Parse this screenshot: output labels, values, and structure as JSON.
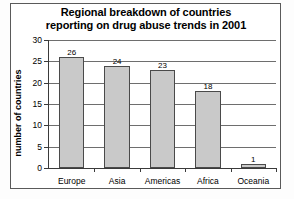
{
  "chart_data": {
    "type": "bar",
    "title": "Regional breakdown of countries reporting on drug abuse trends in 2001",
    "title_lines": [
      "Regional breakdown of countries",
      "reporting on drug abuse trends in 2001"
    ],
    "categories": [
      "Europe",
      "Asia",
      "Americas",
      "Africa",
      "Oceania"
    ],
    "values": [
      26,
      24,
      23,
      18,
      1
    ],
    "value_labels": [
      "26",
      "24",
      "23",
      "18",
      "1"
    ],
    "xlabel": "",
    "ylabel": "number of countries",
    "ylim": [
      0,
      30
    ],
    "ytick_values": [
      0,
      5,
      10,
      15,
      20,
      25,
      30
    ],
    "ytick_labels": [
      "0",
      "5",
      "10",
      "15",
      "20",
      "25",
      "30"
    ],
    "grid": true,
    "grid_axis": "y",
    "legend": false,
    "bar_fill_color": "#c9c9c9",
    "bar_edge_color": "#4a4a4a",
    "axis_color": "#3a3a3a",
    "grid_color": "#6e6e6e",
    "plot_background": "#ffffff",
    "figure_background": "#fdfdfd",
    "text_color": "#000000"
  }
}
